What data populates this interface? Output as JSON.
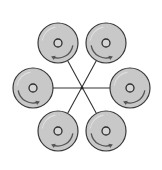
{
  "diagram": {
    "title": "",
    "canvas": {
      "width": 162,
      "height": 170
    },
    "colors": {
      "background": "#ffffff",
      "disc_fill": "#c8c8c8",
      "disc_stroke": "#3a3a3a",
      "spoke": "#333333",
      "arrow": "#555555"
    },
    "hub": {
      "cx": 82,
      "cy": 88
    },
    "disc_radius": 20,
    "hole_radius": 4,
    "discs": [
      {
        "id": "top-left",
        "cx": 58,
        "cy": 43,
        "arrow_direction": "left"
      },
      {
        "id": "top-right",
        "cx": 106,
        "cy": 43,
        "arrow_direction": "right"
      },
      {
        "id": "left",
        "cx": 33,
        "cy": 88,
        "arrow_direction": "right"
      },
      {
        "id": "right",
        "cx": 130,
        "cy": 88,
        "arrow_direction": "left"
      },
      {
        "id": "bottom-left",
        "cx": 58,
        "cy": 131,
        "arrow_direction": "left"
      },
      {
        "id": "bottom-right",
        "cx": 106,
        "cy": 131,
        "arrow_direction": "right"
      }
    ],
    "connections": [
      {
        "from": "left",
        "to": "right"
      },
      {
        "from": "top-left",
        "to": "bottom-right"
      },
      {
        "from": "top-right",
        "to": "bottom-left"
      }
    ]
  }
}
